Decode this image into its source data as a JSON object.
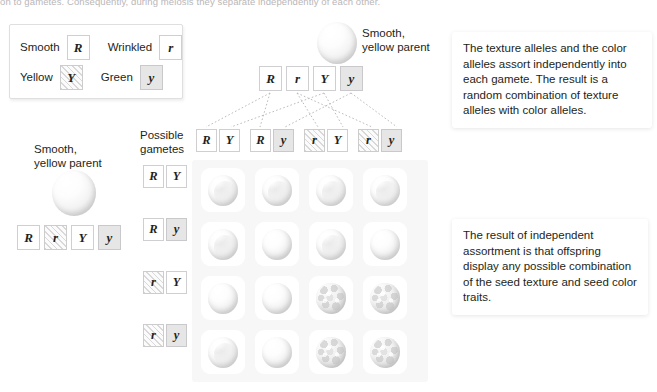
{
  "top_caption": "on to gametes. Consequently, during meiosis they separate independently of each other.",
  "key": {
    "rows": [
      {
        "label_left": "Smooth",
        "allele_left": "R",
        "style_left": "plain",
        "label_right": "Wrinkled",
        "allele_right": "r",
        "style_right": "plain"
      },
      {
        "label_left": "Yellow",
        "allele_left": "Y",
        "style_left": "hatch",
        "label_right": "Green",
        "allele_right": "y",
        "style_right": "grey"
      }
    ]
  },
  "top_parent": {
    "label_line1": "Smooth,",
    "label_line2": "yellow parent",
    "genotype": [
      {
        "allele": "R",
        "style": "plain"
      },
      {
        "allele": "r",
        "style": "plain"
      },
      {
        "allele": "Y",
        "style": "plain"
      },
      {
        "allele": "y",
        "style": "grey"
      }
    ],
    "seed": "smooth-seed"
  },
  "left_parent": {
    "label_line1": "Smooth,",
    "label_line2": "yellow parent",
    "genotype": [
      {
        "allele": "R",
        "style": "plain"
      },
      {
        "allele": "r",
        "style": "hatch"
      },
      {
        "allele": "Y",
        "style": "plain"
      },
      {
        "allele": "y",
        "style": "grey"
      }
    ],
    "seed": "smooth-seed"
  },
  "gametes_label_line1": "Possible",
  "gametes_label_line2": "gametes",
  "column_gametes": [
    {
      "texture": "R",
      "texture_style": "plain",
      "color": "Y",
      "color_style": "plain"
    },
    {
      "texture": "R",
      "texture_style": "plain",
      "color": "y",
      "color_style": "grey"
    },
    {
      "texture": "r",
      "texture_style": "hatch",
      "color": "Y",
      "color_style": "plain"
    },
    {
      "texture": "r",
      "texture_style": "hatch",
      "color": "y",
      "color_style": "grey"
    }
  ],
  "row_gametes": [
    {
      "texture": "R",
      "texture_style": "plain",
      "color": "Y",
      "color_style": "plain"
    },
    {
      "texture": "R",
      "texture_style": "plain",
      "color": "y",
      "color_style": "grey"
    },
    {
      "texture": "r",
      "texture_style": "hatch",
      "color": "Y",
      "color_style": "plain"
    },
    {
      "texture": "r",
      "texture_style": "hatch",
      "color": "y",
      "color_style": "grey"
    }
  ],
  "punnett_cells": [
    [
      "smooth",
      "smooth",
      "smooth",
      "smooth"
    ],
    [
      "smooth",
      "smooth",
      "smooth",
      "smooth"
    ],
    [
      "smooth",
      "smooth",
      "wrinkled",
      "wrinkled"
    ],
    [
      "smooth",
      "smooth",
      "wrinkled",
      "wrinkled"
    ]
  ],
  "callouts": {
    "top": "The texture alleles and the color alleles assort independently into each gamete. The result is a random combination of texture alleles with color alleles.",
    "bottom": "The result of independent assortment is that offspring display any possible combination of the seed texture and seed color traits."
  },
  "colors": {
    "text": "#231f20",
    "tile_border": "#cfcfd1",
    "tile_grey_fill": "#e6e6e6",
    "panel_bg": "#f7f7f7",
    "key_border": "#dfdfe1",
    "dotted_line": "#b3b3b3"
  }
}
